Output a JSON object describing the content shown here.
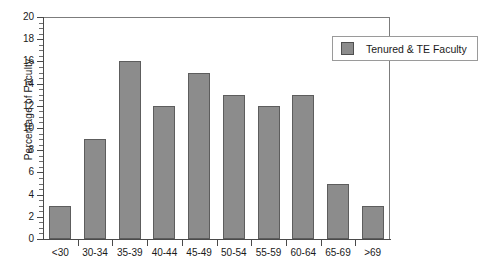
{
  "chart_data": {
    "type": "bar",
    "title": "",
    "xlabel": "",
    "ylabel": "Percentage of Faculty",
    "categories": [
      "<30",
      "30-34",
      "35-39",
      "40-44",
      "45-49",
      "50-54",
      "55-59",
      "60-64",
      "65-69",
      ">69"
    ],
    "values": [
      3,
      9,
      16,
      12,
      15,
      13,
      12,
      13,
      5,
      3
    ],
    "series": [
      {
        "name": "Tenured & TE Faculty",
        "values": [
          3,
          9,
          16,
          12,
          15,
          13,
          12,
          13,
          5,
          3
        ],
        "color": "#8c8c8c"
      }
    ],
    "ylim": [
      0,
      20
    ],
    "ytick_labels": [
      "0",
      "2",
      "4",
      "6",
      "8",
      "10",
      "12",
      "14",
      "16",
      "18",
      "20"
    ],
    "ytick_values": [
      0,
      2,
      4,
      6,
      8,
      10,
      12,
      14,
      16,
      18,
      20
    ],
    "yminor_step": 0.5,
    "grid": false,
    "legend_position": "top-right",
    "legend": [
      {
        "label": "Tenured & TE Faculty",
        "color": "#8c8c8c"
      }
    ]
  },
  "colors": {
    "bar_fill": "#8c8c8c",
    "bar_stroke": "#5d5d5d",
    "axis": "#4a4a4a",
    "frame": "#7c7c7c",
    "text": "#1a1a1a",
    "background": "#ffffff"
  }
}
